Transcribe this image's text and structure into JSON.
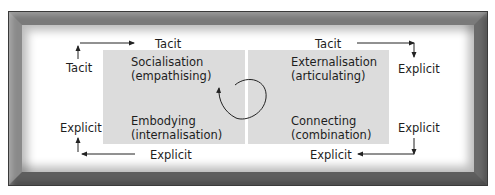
{
  "diagram": {
    "type": "knowledge-conversion-matrix",
    "quadrants": [
      {
        "id": "socialisation",
        "line1": "Socialisation",
        "line2": "(empathising)",
        "position": "top-left"
      },
      {
        "id": "externalisation",
        "line1": "Externalisation",
        "line2": "(articulating)",
        "position": "top-right"
      },
      {
        "id": "embodying",
        "line1": "Embodying",
        "line2": "(internalisation)",
        "position": "bottom-left"
      },
      {
        "id": "connecting",
        "line1": "Connecting",
        "line2": "(combination)",
        "position": "bottom-right"
      }
    ],
    "axis_labels": {
      "top_left_vertical": "Tacit",
      "top_left_horizontal": "Tacit",
      "top_right_horizontal": "Tacit",
      "top_right_vertical": "Explicit",
      "bottom_left_vertical": "Explicit",
      "bottom_left_horizontal": "Explicit",
      "bottom_right_horizontal": "Explicit",
      "bottom_right_vertical": "Explicit"
    },
    "colors": {
      "quadrant_fill": "#dcdcdc",
      "frame": "#6e6e6e",
      "text": "#1e1e1e"
    }
  }
}
